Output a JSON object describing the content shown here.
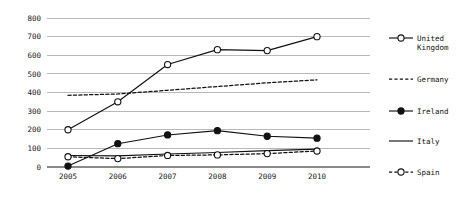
{
  "chart_data": {
    "type": "line",
    "title": "",
    "xlabel": "",
    "ylabel": "",
    "categories": [
      "2005",
      "2006",
      "2007",
      "2008",
      "2009",
      "2010"
    ],
    "x": [
      2005,
      2006,
      2007,
      2008,
      2009,
      2010
    ],
    "ylim": [
      0,
      800
    ],
    "xlim": [
      2005,
      2010
    ],
    "y_ticks": [
      "0",
      "100",
      "200",
      "300",
      "400",
      "500",
      "600",
      "700",
      "800"
    ],
    "y_tick_values": [
      0,
      100,
      200,
      300,
      400,
      500,
      600,
      700,
      800
    ],
    "x_ticks": [
      "2005",
      "2006",
      "2007",
      "2008",
      "2009",
      "2010"
    ],
    "grid": true,
    "legend_position": "right",
    "series": [
      {
        "name": "United Kingdom",
        "style": "solid",
        "marker": "open-circle",
        "values": [
          200,
          350,
          550,
          630,
          625,
          700
        ]
      },
      {
        "name": "Germany",
        "style": "dashed",
        "marker": "none",
        "values": [
          385,
          392,
          412,
          432,
          452,
          468
        ]
      },
      {
        "name": "Ireland",
        "style": "solid",
        "marker": "filled-circle",
        "values": [
          5,
          125,
          172,
          195,
          165,
          155
        ]
      },
      {
        "name": "Italy",
        "style": "solid",
        "marker": "none",
        "values": [
          62,
          60,
          70,
          78,
          88,
          96
        ]
      },
      {
        "name": "Spain",
        "style": "dashed",
        "marker": "open-circle",
        "values": [
          55,
          45,
          62,
          65,
          72,
          86
        ]
      }
    ]
  },
  "legend": {
    "entries": [
      {
        "label": "United Kingdom",
        "line1": "United",
        "line2": "Kingdom"
      },
      {
        "label": "Germany",
        "line1": "Germany",
        "line2": ""
      },
      {
        "label": "Ireland",
        "line1": "Ireland",
        "line2": ""
      },
      {
        "label": "Italy",
        "line1": "Italy",
        "line2": ""
      },
      {
        "label": "Spain",
        "line1": "Spain",
        "line2": ""
      }
    ]
  },
  "colors": {
    "line": "#111111",
    "grid": "#b9b9b9",
    "axis": "#8a8a8a",
    "background": "#ffffff",
    "text": "#1a1a1a"
  }
}
